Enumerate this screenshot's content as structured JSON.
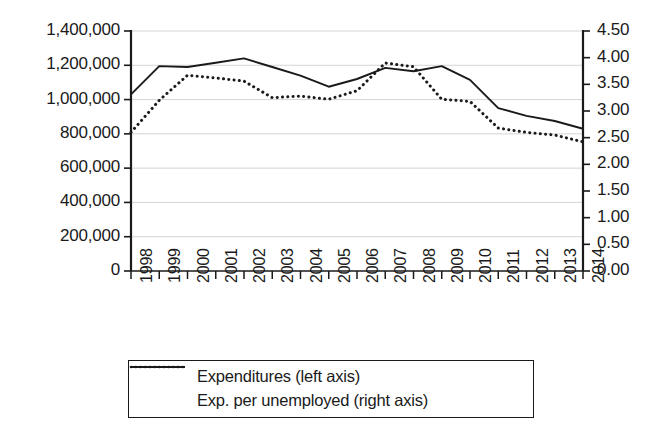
{
  "chart_data": {
    "type": "line",
    "title": "",
    "subtitle": "",
    "xlabel": "",
    "ylabel": "",
    "grid": true,
    "legend_position": "bottom",
    "categories": [
      "1998",
      "1999",
      "2000",
      "2001",
      "2002",
      "2003",
      "2004",
      "2005",
      "2006",
      "2007",
      "2008",
      "2009",
      "2010",
      "2011",
      "2012",
      "2013",
      "2014"
    ],
    "left_axis": {
      "label": "",
      "ylim": [
        0,
        1400000
      ],
      "tick_step": 200000,
      "tick_labels": [
        "1,400,000",
        "1,200,000",
        "1,000,000",
        "800,000",
        "600,000",
        "400,000",
        "200,000",
        "0"
      ],
      "tick_values": [
        1400000,
        1200000,
        1000000,
        800000,
        600000,
        400000,
        200000,
        0
      ]
    },
    "right_axis": {
      "label": "",
      "ylim": [
        0,
        4.5
      ],
      "tick_step": 0.5,
      "tick_labels": [
        "4.50",
        "4.00",
        "3.50",
        "3.00",
        "2.50",
        "2.00",
        "1.50",
        "1.00",
        "0.50",
        "0.00"
      ],
      "tick_values": [
        4.5,
        4.0,
        3.5,
        3.0,
        2.5,
        2.0,
        1.5,
        1.0,
        0.5,
        0.0
      ]
    },
    "series": [
      {
        "name": "Expenditures (left axis)",
        "axis": "left",
        "style": "solid",
        "color": "#1a1a1a",
        "values": [
          1030000,
          1195000,
          1190000,
          1215000,
          1240000,
          1190000,
          1140000,
          1075000,
          1120000,
          1185000,
          1165000,
          1195000,
          1115000,
          950000,
          905000,
          875000,
          830000
        ]
      },
      {
        "name": "Exp. per unemployed (right axis)",
        "axis": "right",
        "style": "dotted",
        "color": "#1a1a1a",
        "values": [
          2.6,
          3.2,
          3.67,
          3.62,
          3.56,
          3.25,
          3.28,
          3.22,
          3.38,
          3.9,
          3.83,
          3.22,
          3.18,
          2.68,
          2.6,
          2.55,
          2.42
        ]
      }
    ]
  },
  "legend": {
    "items": [
      {
        "label": "Expenditures (left axis)",
        "style": "solid"
      },
      {
        "label": "Exp. per unemployed (right axis)",
        "style": "dotted"
      }
    ]
  }
}
